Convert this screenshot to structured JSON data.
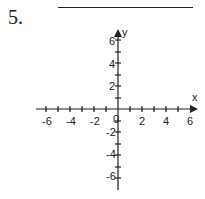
{
  "problem": {
    "number": "5.",
    "answer_blank": ""
  },
  "graph": {
    "x_axis_label": "x",
    "y_axis_label": "y",
    "x_ticks": [
      "-6",
      "-4",
      "-2",
      "0",
      "2",
      "4",
      "6"
    ],
    "y_ticks": [
      "6",
      "4",
      "2",
      "-2",
      "-4",
      "-6"
    ],
    "axis_color": "#222222"
  }
}
